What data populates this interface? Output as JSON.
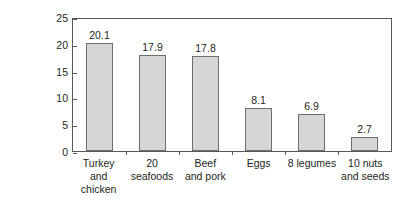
{
  "chart_data": {
    "type": "bar",
    "title": "",
    "xlabel": "",
    "ylabel_lines": [
      "Grams of protein",
      "per 100 kilocalories"
    ],
    "categories": [
      {
        "lines": [
          "Turkey and",
          "chicken"
        ]
      },
      {
        "lines": [
          "20",
          "seafoods"
        ]
      },
      {
        "lines": [
          "Beef",
          "and pork"
        ]
      },
      {
        "lines": [
          "Eggs"
        ]
      },
      {
        "lines": [
          "8 legumes"
        ]
      },
      {
        "lines": [
          "10 nuts",
          "and seeds"
        ]
      }
    ],
    "values": [
      20.1,
      17.9,
      17.8,
      8.1,
      6.9,
      2.7
    ],
    "value_labels": [
      "20.1",
      "17.9",
      "17.8",
      "8.1",
      "6.9",
      "2.7"
    ],
    "ylim": [
      0,
      25
    ],
    "yticks": [
      0,
      5,
      10,
      15,
      20,
      25
    ],
    "ytick_labels": [
      "0",
      "5",
      "10",
      "15",
      "20",
      "25"
    ],
    "grid": false,
    "legend": null,
    "colors": {
      "bar_fill": "#d6d6d6",
      "bar_stroke": "#6d6e71",
      "axis": "#58595b",
      "text": "#231f20",
      "background": "#ffffff"
    }
  }
}
